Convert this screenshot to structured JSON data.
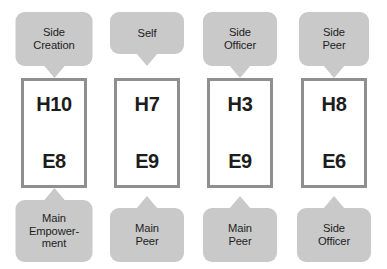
{
  "diagram": {
    "type": "relationship-card-diagram",
    "background_color": "#ffffff",
    "bubble_color": "#c9c9c9",
    "box_border_color": "#8f8f8f",
    "box_fill_color": "#ffffff",
    "text_color": "#1d1d1d",
    "columns": [
      {
        "top_callout": "Side\nCreation",
        "box": {
          "top_label": "H10",
          "bottom_label": "E8"
        },
        "bottom_callout": "Main\nEmpower-\nment"
      },
      {
        "top_callout": "Self",
        "box": {
          "top_label": "H7",
          "bottom_label": "E9"
        },
        "bottom_callout": "Main\nPeer"
      },
      {
        "top_callout": "Side\nOfficer",
        "box": {
          "top_label": "H3",
          "bottom_label": "E9"
        },
        "bottom_callout": "Main\nPeer"
      },
      {
        "top_callout": "Side\nPeer",
        "box": {
          "top_label": "H8",
          "bottom_label": "E6"
        },
        "bottom_callout": "Side\nOfficer"
      }
    ]
  }
}
